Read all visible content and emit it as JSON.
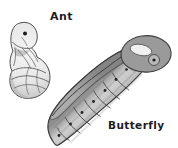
{
  "figure": {
    "background": "#ffffff",
    "labels": {
      "ant": "Ant",
      "butterfly": "Butterfly"
    },
    "colors": {
      "ink": "#1c1c1c",
      "outline": "#3c3c3c",
      "ant_light": "#f5f5f5",
      "ant_shade": "#c7c7c7",
      "chrysalis_center": "#cfcfcf",
      "chrysalis_edge": "#8a8a8a",
      "wing_dark": "#848484",
      "wing_light": "#ababab",
      "loop_fill": "#9a9a9a",
      "hole_fill": "#f0f0f0"
    }
  }
}
